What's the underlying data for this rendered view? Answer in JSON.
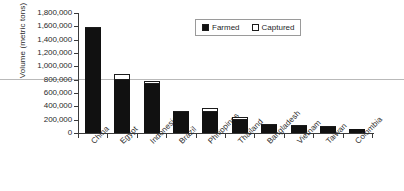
{
  "chart_data": {
    "type": "bar",
    "stacked": true,
    "title": "",
    "xlabel": "",
    "ylabel": "Volume (metric tons)",
    "ylim": [
      0,
      1800000
    ],
    "ytick_labels": [
      "1,800,000",
      "1,600,000",
      "1,400,000",
      "1,200,000",
      "1,000,000",
      "800,000",
      "600,000",
      "400,000",
      "200,000",
      "0"
    ],
    "ytick_values": [
      1800000,
      1600000,
      1400000,
      1200000,
      1000000,
      800000,
      600000,
      400000,
      200000,
      0
    ],
    "ytick_interval": 200000,
    "grid": false,
    "legend_position": "top-center",
    "categories": [
      "China",
      "Egypt",
      "Indonesia",
      "Brazil",
      "Philippines",
      "Thailand",
      "Bangladesh",
      "Vietnam",
      "Taiwan",
      "Colombia"
    ],
    "series": [
      {
        "name": "Farmed",
        "color": "#111111",
        "values": [
          1580000,
          790000,
          735000,
          320000,
          315000,
          195000,
          125000,
          110000,
          90000,
          60000
        ]
      },
      {
        "name": "Captured",
        "color": "#ffffff",
        "values": [
          15000,
          90000,
          45000,
          15000,
          60000,
          45000,
          10000,
          8000,
          8000,
          6000
        ]
      }
    ]
  },
  "legend": {
    "items": [
      {
        "label": "Farmed",
        "swatch": "filled-square-icon"
      },
      {
        "label": "Captured",
        "swatch": "empty-square-icon"
      }
    ]
  }
}
